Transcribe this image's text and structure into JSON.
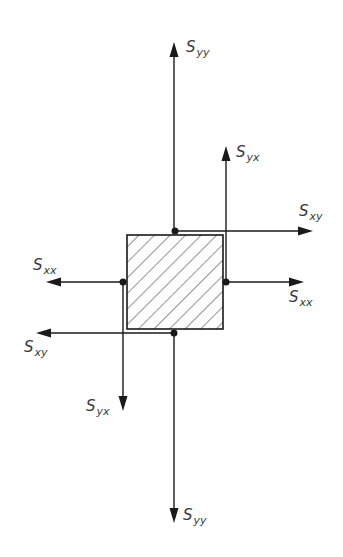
{
  "diagram": {
    "colors": {
      "line": "#1a1a1a",
      "label": "#3a3a3a",
      "hatch": "#2a2a2a",
      "background": "#ffffff"
    },
    "element": {
      "x": 127,
      "y": 235,
      "width": 96,
      "height": 94,
      "fill": "hatched-diagonal"
    },
    "labels": {
      "syy_top": {
        "main": "S",
        "sub": "yy"
      },
      "syx_right": {
        "main": "S",
        "sub": "yx"
      },
      "sxy_right": {
        "main": "S",
        "sub": "xy"
      },
      "sxx_right": {
        "main": "S",
        "sub": "xx"
      },
      "sxx_left": {
        "main": "S",
        "sub": "xx"
      },
      "sxy_left": {
        "main": "S",
        "sub": "xy"
      },
      "syx_bottom": {
        "main": "S",
        "sub": "yx"
      },
      "syy_bottom": {
        "main": "S",
        "sub": "yy"
      }
    },
    "arrows": [
      {
        "name": "syy-top-arrow",
        "from": [
          174,
          231
        ],
        "to": [
          174,
          42
        ]
      },
      {
        "name": "syx-right-arrow",
        "from": [
          226,
          282
        ],
        "to": [
          226,
          146
        ]
      },
      {
        "name": "sxy-right-arrow",
        "from": [
          174,
          231
        ],
        "to": [
          313,
          231
        ]
      },
      {
        "name": "sxx-right-arrow",
        "from": [
          226,
          282
        ],
        "to": [
          304,
          282
        ]
      },
      {
        "name": "sxx-left-arrow",
        "from": [
          123,
          282
        ],
        "to": [
          46,
          282
        ]
      },
      {
        "name": "sxy-left-arrow",
        "from": [
          174,
          333
        ],
        "to": [
          36,
          333
        ]
      },
      {
        "name": "syx-bottom-arrow",
        "from": [
          123,
          282
        ],
        "to": [
          123,
          411
        ]
      },
      {
        "name": "syy-bottom-arrow",
        "from": [
          174,
          333
        ],
        "to": [
          174,
          523
        ]
      }
    ],
    "points": [
      {
        "name": "top-point",
        "x": 175,
        "y": 231
      },
      {
        "name": "left-point",
        "x": 123,
        "y": 282
      },
      {
        "name": "right-point",
        "x": 226,
        "y": 282
      },
      {
        "name": "bottom-point",
        "x": 174,
        "y": 333
      }
    ]
  }
}
